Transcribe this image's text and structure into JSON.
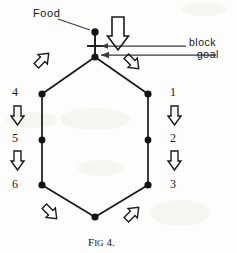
{
  "figure": {
    "caption_prefix": "F",
    "caption_smallcaps": "IG",
    "caption_suffix": " 4.",
    "caption_full": "FIG 4.",
    "background_color": "#fdfdfc",
    "ink_color": "#18181a"
  },
  "labels": {
    "food": "Food",
    "block": "block",
    "goal": "goal"
  },
  "nodes": {
    "food_dot": "food-point",
    "goal_dot": "goal-point",
    "block_bar": "block-barrier"
  },
  "left_column": {
    "items": [
      {
        "label": "4",
        "x": 15,
        "y": 92
      },
      {
        "label": "5",
        "x": 15,
        "y": 138
      },
      {
        "label": "6",
        "x": 15,
        "y": 184
      }
    ],
    "arrows": [
      {
        "name": "down-arrow-left-upper",
        "x": 17,
        "y": 113
      },
      {
        "name": "down-arrow-left-lower",
        "x": 17,
        "y": 158
      }
    ]
  },
  "right_column": {
    "items": [
      {
        "label": "1",
        "x": 172,
        "y": 92
      },
      {
        "label": "2",
        "x": 172,
        "y": 138
      },
      {
        "label": "3",
        "x": 172,
        "y": 184
      }
    ],
    "arrows": [
      {
        "name": "down-arrow-right-upper",
        "x": 174,
        "y": 113
      },
      {
        "name": "down-arrow-right-lower",
        "x": 174,
        "y": 158
      }
    ]
  },
  "diagonal_arrows": [
    {
      "name": "arrow-up-left-top-left",
      "direction": "up-left"
    },
    {
      "name": "arrow-down-right-top-right",
      "direction": "down-right"
    },
    {
      "name": "arrow-down-right-bottom-left",
      "direction": "down-right"
    },
    {
      "name": "arrow-up-left-bottom-right",
      "direction": "up-left"
    }
  ],
  "hexagon": {
    "vertices": [
      {
        "name": "vertex-top",
        "x": 95,
        "y": 57
      },
      {
        "name": "vertex-upper-right",
        "x": 148,
        "y": 94
      },
      {
        "name": "vertex-lower-right",
        "x": 148,
        "y": 185
      },
      {
        "name": "vertex-bottom",
        "x": 95,
        "y": 217
      },
      {
        "name": "vertex-lower-left",
        "x": 42,
        "y": 185
      },
      {
        "name": "vertex-upper-left",
        "x": 42,
        "y": 94
      }
    ],
    "midpoints": [
      {
        "name": "midpoint-left",
        "x": 42,
        "y": 140
      },
      {
        "name": "midpoint-right",
        "x": 148,
        "y": 140
      }
    ]
  }
}
